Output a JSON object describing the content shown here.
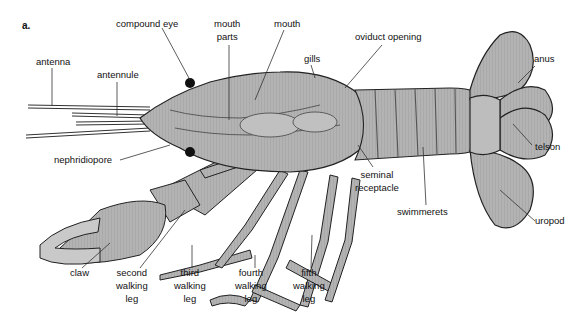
{
  "figure": {
    "panel_label": "a."
  },
  "labels": {
    "compound_eye": "compound eye",
    "mouth_parts": [
      "mouth",
      "parts"
    ],
    "mouth": "mouth",
    "antenna": "antenna",
    "antennule": "antennule",
    "gills": "gills",
    "oviduct_opening": "oviduct opening",
    "anus": "anus",
    "nephridiopore": "nephridiopore",
    "telson": "telson",
    "seminal_receptacle": [
      "seminal",
      "receptacle"
    ],
    "swimmerets": "swimmerets",
    "uropod": "uropod",
    "claw": "claw",
    "second_walking_leg": [
      "second",
      "walking",
      "leg"
    ],
    "third_walking_leg": [
      "third",
      "walking",
      "leg"
    ],
    "fourth_walking_leg": [
      "fourth",
      "walking",
      "leg"
    ],
    "fifth_walking_leg": [
      "fifth",
      "walking",
      "leg"
    ]
  },
  "colors": {
    "body_fill": "#a9a9a9",
    "body_light": "#c4c4c4",
    "outline": "#222222",
    "leader_line": "#333333",
    "background": "#ffffff"
  }
}
